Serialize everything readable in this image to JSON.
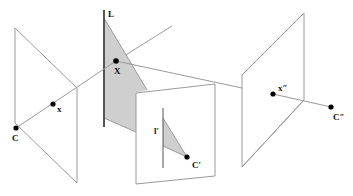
{
  "figure": {
    "labels": {
      "line_L": "L",
      "point_X": "X",
      "camera_C": "C",
      "image_point_x": "x",
      "image_line_lprime": "l′",
      "camera_Cprime": "C′",
      "image_point_xdprime": "x″",
      "camera_Cdprime": "C″"
    },
    "colors": {
      "plane_stroke": "#9a9a9a",
      "shaded_plane": "#cfcfcf",
      "line": "#555555",
      "point": "#000000"
    },
    "elements": {
      "image_planes": [
        "left",
        "middle",
        "right"
      ],
      "points": [
        "C",
        "x",
        "X",
        "C′",
        "x″",
        "C″"
      ],
      "lines": [
        "L",
        "l′"
      ]
    }
  }
}
